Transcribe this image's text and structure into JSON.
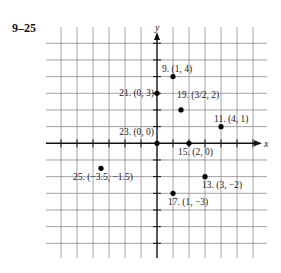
{
  "title": "9–25",
  "chart_data": {
    "type": "scatter",
    "title": "9–25",
    "xlabel": "x",
    "ylabel": "y",
    "xlim": [
      -6,
      6
    ],
    "ylim": [
      -6,
      6
    ],
    "grid": true,
    "points": [
      {
        "label": "9. (1, 4)",
        "x": 1,
        "y": 4,
        "dx": -11,
        "dy": -5,
        "anchor": "start"
      },
      {
        "label": "11. (4, 1)",
        "x": 4,
        "y": 1,
        "dx": -7,
        "dy": -5,
        "anchor": "start"
      },
      {
        "label": "13. (3, −2)",
        "x": 3,
        "y": -2,
        "dx": -3,
        "dy": 11,
        "anchor": "start"
      },
      {
        "label": "15. (2, 0)",
        "x": 2,
        "y": 0,
        "dx": -11,
        "dy": 12,
        "anchor": "start"
      },
      {
        "label": "17. (1, −3)",
        "x": 1,
        "y": -3,
        "dx": -5,
        "dy": 12,
        "anchor": "start"
      },
      {
        "label": "19. (3/2, 2)",
        "x": 1.5,
        "y": 2,
        "dx": -4,
        "dy": -12,
        "anchor": "start"
      },
      {
        "label": "21. (0, 3)",
        "x": 0,
        "y": 3,
        "dx": -3,
        "dy": 3,
        "anchor": "end"
      },
      {
        "label": "23. (0, 0)",
        "x": 0,
        "y": 0,
        "dx": -3,
        "dy": -8,
        "anchor": "end"
      },
      {
        "label": "25. (−3.5, −1.5)",
        "x": -3.5,
        "y": -1.5,
        "dx": -28,
        "dy": 12,
        "anchor": "start"
      }
    ]
  },
  "colors": {
    "grid": "#8a8a8a",
    "axis": "#111111",
    "point": "#000000"
  }
}
